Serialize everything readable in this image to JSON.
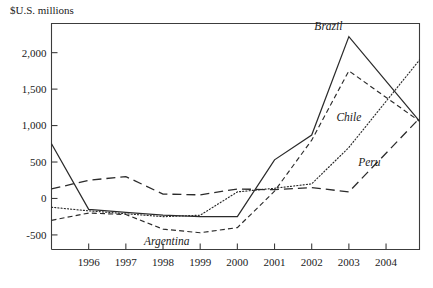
{
  "chart_data": {
    "type": "line",
    "title": "",
    "subtitle": "",
    "ylabel": "$U.S. millions",
    "xlabel": "",
    "ylim": [
      -700,
      2400
    ],
    "yticks": [
      -500,
      0,
      500,
      1000,
      1500,
      2000
    ],
    "ytick_labels": [
      "-500",
      "0",
      "500",
      "1,000",
      "1,500",
      "2,000"
    ],
    "x": [
      1995,
      1996,
      1997,
      1998,
      1999,
      2000,
      2001,
      2002,
      2003,
      2004.9
    ],
    "xticks": [
      1996,
      1997,
      1998,
      1999,
      2000,
      2001,
      2002,
      2003,
      2004
    ],
    "xtick_labels": [
      "1996",
      "1997",
      "1998",
      "1999",
      "2000",
      "2001",
      "2002",
      "2003",
      "2004"
    ],
    "xlim": [
      1995,
      2004.9
    ],
    "grid": false,
    "legend": "inline-annotations",
    "series": [
      {
        "name": "Brazil",
        "style": "solid",
        "label_x": 2002.45,
        "label_y": 2310,
        "values": [
          750,
          -150,
          -190,
          -230,
          -250,
          -250,
          530,
          870,
          2220,
          1060
        ]
      },
      {
        "name": "Argentina",
        "style": "short-dash",
        "label_x": 1998.1,
        "label_y": -640,
        "values": [
          -300,
          -200,
          -220,
          -420,
          -470,
          -400,
          100,
          800,
          1750,
          1060
        ]
      },
      {
        "name": "Peru",
        "style": "long-dash",
        "label_x": 2003.55,
        "label_y": 440,
        "values": [
          130,
          250,
          300,
          60,
          50,
          130,
          120,
          150,
          90,
          1100
        ]
      },
      {
        "name": "Chile",
        "style": "dotted",
        "label_x": 2003.0,
        "label_y": 1060,
        "values": [
          -120,
          -170,
          -210,
          -250,
          -230,
          90,
          140,
          200,
          700,
          1900
        ]
      }
    ]
  }
}
